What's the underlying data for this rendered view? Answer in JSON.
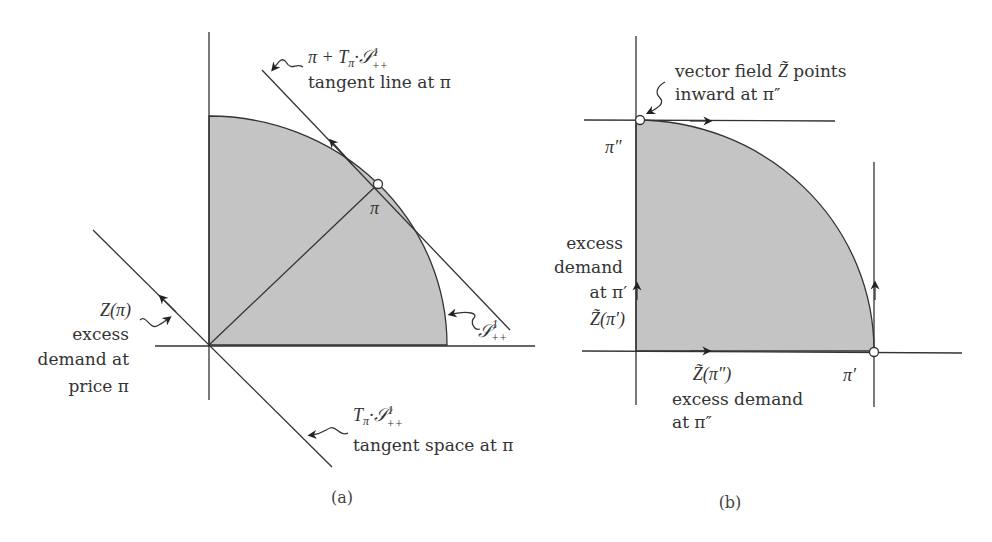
{
  "figure": {
    "panel_a": {
      "caption": "(a)",
      "point_label": "π",
      "tangent_line_label_math_base": "π + T",
      "tangent_line_label_math_sub": "π",
      "tangent_line_label_math_set": "·𝒮",
      "tangent_line_label_sup": "1",
      "tangent_line_label_sub2": "++",
      "tangent_line_label_text": "tangent line at π",
      "sphere_label_set": "𝒮",
      "sphere_label_sup": "1",
      "sphere_label_sub": "++",
      "excess_demand_math": "Z(π)",
      "excess_demand_line1": "excess",
      "excess_demand_line2": "demand at",
      "excess_demand_line3": "price  π",
      "tangent_space_math_base": "T",
      "tangent_space_math_sub": "π",
      "tangent_space_math_set": "·𝒮",
      "tangent_space_sup": "1",
      "tangent_space_sub2": "++",
      "tangent_space_text": "tangent space at π"
    },
    "panel_b": {
      "caption": "(b)",
      "vector_field_line1_pre": "vector field ",
      "vector_field_symbol": "Z̃",
      "vector_field_line1_post": " points",
      "vector_field_line2": "inward at π″",
      "pi_double_prime": "π″",
      "pi_prime": "π′",
      "left_label_line1": "excess",
      "left_label_line2": "demand",
      "left_label_line3": "at π′",
      "left_label_math": "Z̃(π′)",
      "bottom_label_math": "Z̃(π″)",
      "bottom_label_line1": "excess demand",
      "bottom_label_line2": "at π″"
    },
    "colors": {
      "shade": "#c4c4c4",
      "stroke": "#333333",
      "background": "#ffffff"
    }
  }
}
